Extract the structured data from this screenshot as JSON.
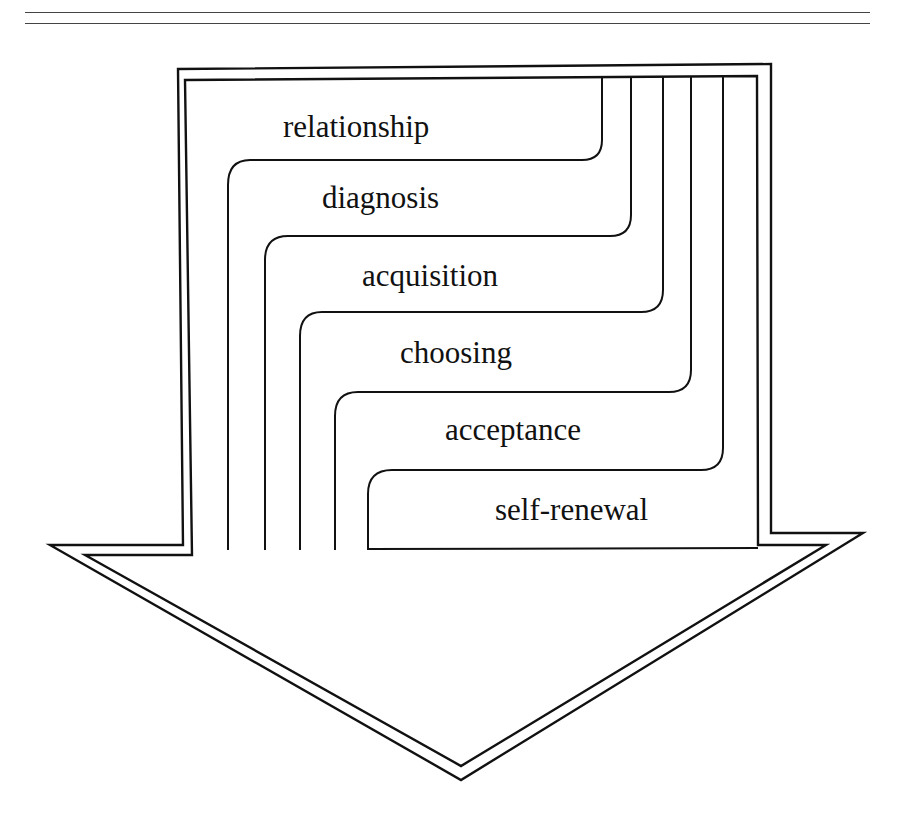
{
  "page": {
    "header_text": "",
    "has_double_rule": true
  },
  "diagram": {
    "shape": "downward-arrow",
    "stroke_color": "#111111",
    "background_color": "#ffffff",
    "stages": [
      {
        "order": 1,
        "label": "relationship"
      },
      {
        "order": 2,
        "label": "diagnosis"
      },
      {
        "order": 3,
        "label": "acquisition"
      },
      {
        "order": 4,
        "label": "choosing"
      },
      {
        "order": 5,
        "label": "acceptance"
      },
      {
        "order": 6,
        "label": "self-renewal"
      }
    ]
  }
}
